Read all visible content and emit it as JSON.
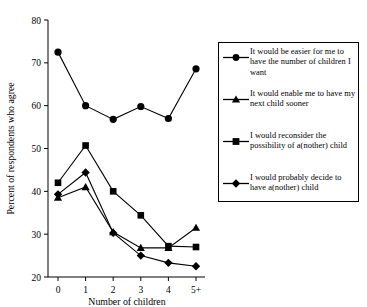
{
  "chart_data": {
    "type": "line",
    "title": "",
    "xlabel": "Number of children",
    "ylabel": "Percent of respondents who agree",
    "categories": [
      "0",
      "1",
      "2",
      "3",
      "4",
      "5+"
    ],
    "ylim": [
      20,
      80
    ],
    "yticks": [
      20,
      30,
      40,
      50,
      60,
      70,
      80
    ],
    "grid": false,
    "legend_position": "right",
    "series": [
      {
        "name": "It would be easier for me to have the number of children I want",
        "marker": "circle",
        "color": "#000000",
        "values": [
          72.5,
          60.0,
          56.8,
          59.8,
          57.0,
          68.6
        ]
      },
      {
        "name": "It would enable me to have my next child sooner",
        "marker": "triangle",
        "color": "#000000",
        "values": [
          38.5,
          41.0,
          30.5,
          26.8,
          26.8,
          31.5
        ]
      },
      {
        "name": "I would reconsider the possibility of a(nother) child",
        "marker": "square",
        "color": "#000000",
        "values": [
          42.0,
          50.7,
          40.0,
          34.4,
          27.2,
          27.0
        ]
      },
      {
        "name": "I would probably decide to have a(nother) child",
        "marker": "diamond",
        "color": "#000000",
        "values": [
          39.3,
          44.4,
          30.3,
          25.0,
          23.3,
          22.5
        ]
      }
    ]
  },
  "axis": {
    "ytick_labels": [
      "80",
      "70",
      "60",
      "50",
      "40",
      "30",
      "20"
    ],
    "xtick_labels": [
      "0",
      "1",
      "2",
      "3",
      "4",
      "5+"
    ],
    "ylabel": "Percent of respondents who agree",
    "xlabel": "Number of children"
  },
  "legend": {
    "entries": [
      {
        "marker": "circle",
        "label": "It would be easier for me to have the number of children I want"
      },
      {
        "marker": "triangle",
        "label": "It would enable me to have my next child sooner"
      },
      {
        "marker": "square",
        "label": "I would reconsider the possibility of a(nother) child"
      },
      {
        "marker": "diamond",
        "label": "I would probably decide to have a(nother) child"
      }
    ]
  }
}
